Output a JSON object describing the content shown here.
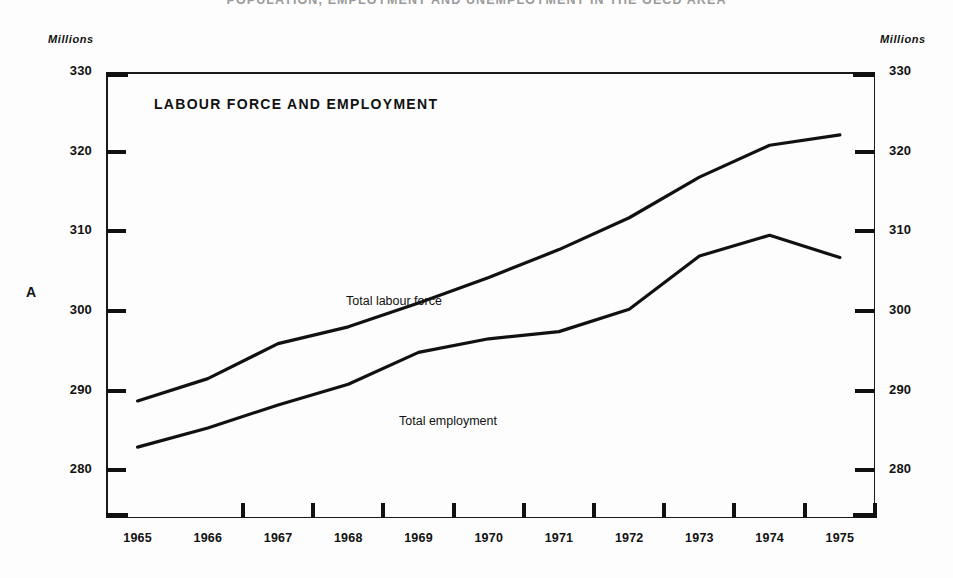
{
  "document": {
    "title": "POPULATION, EMPLOYMENT AND UNEMPLOYMENT IN THE OECD AREA"
  },
  "panel": {
    "letter": "A",
    "title": "LABOUR FORCE AND EMPLOYMENT",
    "unit_left": "Millions",
    "unit_right": "Millions"
  },
  "axis": {
    "y_ticks": [
      "330",
      "320",
      "310",
      "300",
      "290",
      "280"
    ],
    "y_ticks_right": [
      "330",
      "320",
      "310",
      "300",
      "290",
      "280"
    ],
    "x_ticks": [
      "1965",
      "1966",
      "1967",
      "1968",
      "1969",
      "1970",
      "1971",
      "1972",
      "1973",
      "1974",
      "1975"
    ]
  },
  "series_labels": {
    "labour_force": "Total labour force",
    "employment": "Total employment"
  },
  "colors": {
    "line": "#111111",
    "frame": "#1a1a1a",
    "background": "#fdfdfd",
    "text": "#111111"
  },
  "chart_data": {
    "type": "line",
    "title": "LABOUR FORCE AND EMPLOYMENT",
    "subtitle": "POPULATION, EMPLOYMENT AND UNEMPLOYMENT IN THE OECD AREA",
    "xlabel": "",
    "ylabel": "Millions",
    "x": [
      1965,
      1966,
      1967,
      1968,
      1969,
      1970,
      1971,
      1972,
      1973,
      1974,
      1975
    ],
    "xlim": [
      1964.55,
      1975.5
    ],
    "ylim": [
      274.0,
      330.0
    ],
    "yticks": [
      280,
      290,
      300,
      310,
      320,
      330
    ],
    "grid": false,
    "legend": "inline-annotations",
    "series": [
      {
        "name": "Total labour force",
        "values": [
          288.7,
          291.5,
          295.9,
          298.0,
          301.0,
          304.2,
          307.7,
          311.7,
          316.8,
          320.8,
          322.1
        ]
      },
      {
        "name": "Total employment",
        "values": [
          282.9,
          285.3,
          288.2,
          290.8,
          294.8,
          296.5,
          297.4,
          300.2,
          306.9,
          309.5,
          306.7
        ]
      }
    ]
  }
}
